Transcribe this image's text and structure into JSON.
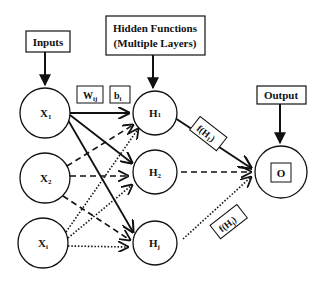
{
  "diagram": {
    "type": "neural-network",
    "labels": {
      "inputs": "Inputs",
      "hidden_line1": "Hidden Functions",
      "hidden_line2": "(Multiple Layers)",
      "output": "Output",
      "weight": "W",
      "weight_sub": "ij",
      "bias": "b",
      "bias_sub": "i",
      "f_h1": "f(H",
      "f_h1_sub": "1",
      "f_hj": "f(H",
      "f_hj_sub": "j",
      "close_paren": ")"
    },
    "input_nodes": [
      {
        "id": "x1",
        "label": "X",
        "sub": "1"
      },
      {
        "id": "x2",
        "label": "X",
        "sub": "2"
      },
      {
        "id": "xi",
        "label": "X",
        "sub": "i"
      }
    ],
    "hidden_nodes": [
      {
        "id": "h1",
        "label": "H",
        "sub": "1"
      },
      {
        "id": "h2",
        "label": "H",
        "sub": "2"
      },
      {
        "id": "hj",
        "label": "H",
        "sub": "j"
      }
    ],
    "output_node": {
      "id": "o",
      "label": "O"
    },
    "edges": [
      {
        "from": "x1",
        "to": "h1",
        "style": "solid"
      },
      {
        "from": "x1",
        "to": "h2",
        "style": "solid"
      },
      {
        "from": "x1",
        "to": "hj",
        "style": "solid"
      },
      {
        "from": "x2",
        "to": "h1",
        "style": "dashed"
      },
      {
        "from": "x2",
        "to": "h2",
        "style": "dashed"
      },
      {
        "from": "x2",
        "to": "hj",
        "style": "dashed"
      },
      {
        "from": "xi",
        "to": "h1",
        "style": "dotted"
      },
      {
        "from": "xi",
        "to": "h2",
        "style": "dotted"
      },
      {
        "from": "xi",
        "to": "hj",
        "style": "dotted"
      },
      {
        "from": "h1",
        "to": "o",
        "style": "solid"
      },
      {
        "from": "h2",
        "to": "o",
        "style": "dashed"
      },
      {
        "from": "hj",
        "to": "o",
        "style": "dotted"
      }
    ],
    "colors": {
      "stroke": "#111111",
      "background": "#ffffff"
    }
  }
}
